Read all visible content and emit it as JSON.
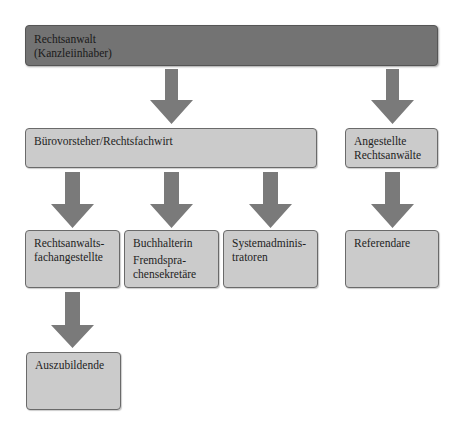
{
  "diagram": {
    "type": "org-chart",
    "colors": {
      "top_box": "#737373",
      "box": "#cbcbcb",
      "border": "#6a6a6a",
      "arrow": "#7a7a7a",
      "text": "#1e1e1e"
    },
    "nodes": {
      "owner": {
        "lines": [
          "Rechtsanwalt",
          "(Kanzleiinhaber)"
        ]
      },
      "office_manager": {
        "lines": [
          "Bürovorsteher/Rechtsfachwirt"
        ]
      },
      "employed_lawyers": {
        "lines": [
          "Angestellte",
          "Rechtsanwälte"
        ]
      },
      "paralegals": {
        "lines": [
          "Rechtsanwalts-",
          "fachangestellte"
        ]
      },
      "accounting": {
        "lines": [
          "Buchhalterin",
          "Fremdspra-",
          "chensekretäre"
        ]
      },
      "sysadmins": {
        "lines": [
          "Systemadminis-",
          "tratoren"
        ]
      },
      "trainee_lawyers": {
        "lines": [
          "Referendare"
        ]
      },
      "apprentices": {
        "lines": [
          "Auszubildende"
        ]
      }
    },
    "edges": [
      [
        "owner",
        "office_manager"
      ],
      [
        "owner",
        "employed_lawyers"
      ],
      [
        "office_manager",
        "paralegals"
      ],
      [
        "office_manager",
        "accounting"
      ],
      [
        "office_manager",
        "sysadmins"
      ],
      [
        "employed_lawyers",
        "trainee_lawyers"
      ],
      [
        "paralegals",
        "apprentices"
      ]
    ]
  }
}
